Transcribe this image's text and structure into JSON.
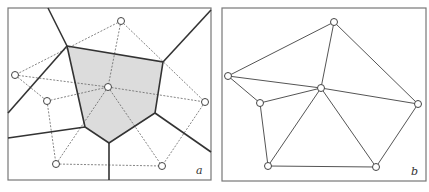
{
  "figure": {
    "colors": {
      "frame": "#777777",
      "voronoi_edge": "#333333",
      "delaunay_dashed": "#666666",
      "delaunay_solid": "#555555",
      "cell_fill": "#dcdcdc",
      "point_stroke": "#444444",
      "point_fill": "#ffffff"
    },
    "panels": [
      {
        "id": "a",
        "label": "a",
        "frame": [
          8,
          8,
          203,
          172
        ],
        "points": [
          [
            121,
            21
          ],
          [
            15,
            75
          ],
          [
            108,
            87
          ],
          [
            47,
            101
          ],
          [
            205,
            102
          ],
          [
            56,
            164
          ],
          [
            162,
            166
          ]
        ],
        "highlighted_cell": [
          [
            67,
            46
          ],
          [
            163,
            62
          ],
          [
            155,
            113
          ],
          [
            109,
            143
          ],
          [
            85,
            127
          ]
        ],
        "voronoi_edges": [
          [
            [
              67,
              46
            ],
            [
              48,
              8
            ]
          ],
          [
            [
              163,
              62
            ],
            [
              211,
              10
            ]
          ],
          [
            [
              67,
              46
            ],
            [
              8,
              113
            ]
          ],
          [
            [
              85,
              127
            ],
            [
              8,
              138
            ]
          ],
          [
            [
              109,
              143
            ],
            [
              109,
              180
            ]
          ],
          [
            [
              155,
              113
            ],
            [
              211,
              152
            ]
          ]
        ],
        "delaunay_edges": [
          [
            0,
            1
          ],
          [
            0,
            2
          ],
          [
            0,
            4
          ],
          [
            1,
            2
          ],
          [
            1,
            3
          ],
          [
            3,
            2
          ],
          [
            2,
            4
          ],
          [
            3,
            5
          ],
          [
            2,
            5
          ],
          [
            2,
            6
          ],
          [
            4,
            6
          ],
          [
            5,
            6
          ]
        ]
      },
      {
        "id": "b",
        "label": "b",
        "frame": [
          222,
          8,
          204,
          173
        ],
        "points": [
          [
            334,
            22
          ],
          [
            228,
            76
          ],
          [
            321,
            88
          ],
          [
            260,
            103
          ],
          [
            418,
            104
          ],
          [
            268,
            166
          ],
          [
            376,
            167
          ]
        ],
        "delaunay_edges": [
          [
            0,
            1
          ],
          [
            0,
            2
          ],
          [
            0,
            4
          ],
          [
            1,
            2
          ],
          [
            1,
            3
          ],
          [
            3,
            2
          ],
          [
            2,
            4
          ],
          [
            3,
            5
          ],
          [
            2,
            5
          ],
          [
            2,
            6
          ],
          [
            4,
            6
          ],
          [
            5,
            6
          ]
        ]
      }
    ]
  }
}
